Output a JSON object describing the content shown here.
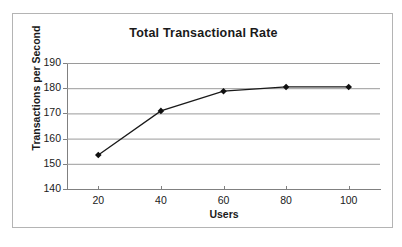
{
  "chart_data": {
    "type": "line",
    "title": "Total Transactional Rate",
    "xlabel": "Users",
    "ylabel": "Transactions per Second",
    "x": [
      20,
      40,
      60,
      80,
      100
    ],
    "values": [
      153.5,
      171.0,
      178.8,
      180.5,
      180.5
    ],
    "series": [
      {
        "name": "Total Transactional Rate",
        "values": [
          153.5,
          171.0,
          178.8,
          180.5,
          180.5
        ]
      }
    ],
    "xlim": [
      10,
      110
    ],
    "ylim": [
      140,
      190
    ],
    "xticks": [
      "20",
      "40",
      "60",
      "80",
      "100"
    ],
    "yticks": [
      "140",
      "150",
      "160",
      "170",
      "180",
      "190"
    ],
    "grid": "horizontal",
    "legend": "none",
    "marker": "diamond",
    "colors": {
      "line": "#1a1a1a",
      "marker": "#101010",
      "gridline": "#9a9a9a",
      "axis": "#808080",
      "border": "#b4b4b4",
      "background": "#ffffff",
      "text": "#1a1a1a"
    }
  }
}
